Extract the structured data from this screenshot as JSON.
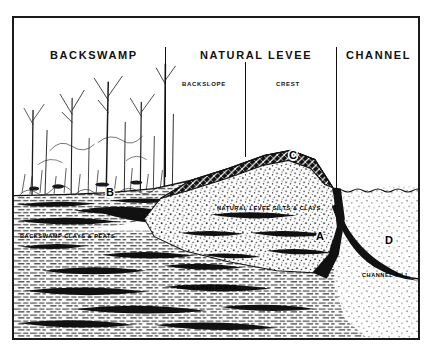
{
  "figure": {
    "type": "geologic-cross-section"
  },
  "zones": [
    {
      "id": "backswamp",
      "label": "BACKSWAMP",
      "x": 48,
      "y": 47
    },
    {
      "id": "natural-levee",
      "label": "NATURAL LEVEE",
      "x": 198,
      "y": 47
    },
    {
      "id": "channel",
      "label": "CHANNEL",
      "x": 344,
      "y": 47
    }
  ],
  "subzones": [
    {
      "id": "backslope",
      "label": "BACKSLOPE",
      "x": 180,
      "y": 79
    },
    {
      "id": "crest",
      "label": "CREST",
      "x": 274,
      "y": 79
    }
  ],
  "dividers": [
    {
      "id": "backswamp-levee-divider",
      "x": 163,
      "top": 45,
      "height": 130
    },
    {
      "id": "backslope-crest-divider",
      "x": 243,
      "top": 60,
      "height": 95
    },
    {
      "id": "levee-channel-divider",
      "x": 334,
      "top": 45,
      "height": 150
    }
  ],
  "units": [
    {
      "id": "natural-levee-silts-clays",
      "label": "NATURAL LEVEE SILTS & CLAYS",
      "x": 215,
      "y": 203
    },
    {
      "id": "backswamp-clays-peats",
      "label": "BACKSWAMP CLAYS & PEATS",
      "x": 14,
      "y": 231
    },
    {
      "id": "pre-levee-clays",
      "label": "PRE-LEVEE CLAYS",
      "x": 175,
      "y": 282
    },
    {
      "id": "channel-fill",
      "label": "CHANNEL FILL",
      "x": 360,
      "y": 270
    }
  ],
  "markers": [
    {
      "id": "marker-a",
      "label": "A",
      "x": 314,
      "y": 228
    },
    {
      "id": "marker-b",
      "label": "B",
      "x": 104,
      "y": 184
    },
    {
      "id": "marker-c",
      "label": "C",
      "x": 287,
      "y": 147
    },
    {
      "id": "marker-d",
      "label": "D",
      "x": 383,
      "y": 232
    }
  ],
  "colors": {
    "ink": "#111111",
    "paper": "#ffffff",
    "stipple": "#1a1a1a",
    "hatch": "#2a2a2a"
  }
}
